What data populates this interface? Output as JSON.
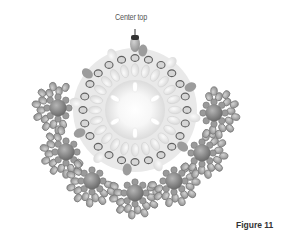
{
  "diagram": {
    "title": "Figure 11",
    "annotation": "Center top",
    "colors": {
      "background": "#ffffff",
      "center_glow": "#ffffff",
      "inner_beads": "#e8e8e8",
      "outlined_beads": "#cfcfcf",
      "bead_outline": "#6e6e6e",
      "dark_beads": "#8a8a8a",
      "large_beads": "#7c7c7c",
      "petal_beads": "#a8a8a8"
    },
    "structure": {
      "center": {
        "x": 135,
        "y": 110
      },
      "spoke_count": 6,
      "cluster_count": 7,
      "clusters": [
        {
          "x": 58,
          "y": 108
        },
        {
          "x": 66,
          "y": 152
        },
        {
          "x": 92,
          "y": 181
        },
        {
          "x": 135,
          "y": 193
        },
        {
          "x": 174,
          "y": 181
        },
        {
          "x": 202,
          "y": 153
        },
        {
          "x": 214,
          "y": 113
        }
      ]
    }
  }
}
